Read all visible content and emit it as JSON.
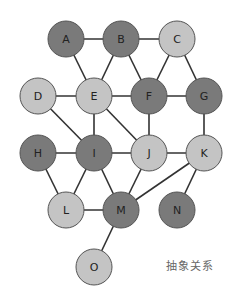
{
  "caption": "抽象关系",
  "colors": {
    "dark": "#7a7a7a",
    "light": "#c4c4c4",
    "stroke": "#555555",
    "edge": "#333333",
    "label": "#222222"
  },
  "radius": 18,
  "nodes": [
    {
      "id": "A",
      "x": 66,
      "y": 39,
      "shade": "dark"
    },
    {
      "id": "B",
      "x": 121,
      "y": 39,
      "shade": "dark"
    },
    {
      "id": "C",
      "x": 177,
      "y": 39,
      "shade": "light"
    },
    {
      "id": "D",
      "x": 38,
      "y": 96,
      "shade": "light"
    },
    {
      "id": "E",
      "x": 94,
      "y": 96,
      "shade": "light"
    },
    {
      "id": "F",
      "x": 149,
      "y": 96,
      "shade": "dark"
    },
    {
      "id": "G",
      "x": 204,
      "y": 96,
      "shade": "dark"
    },
    {
      "id": "H",
      "x": 38,
      "y": 153,
      "shade": "dark"
    },
    {
      "id": "I",
      "x": 94,
      "y": 153,
      "shade": "dark"
    },
    {
      "id": "J",
      "x": 149,
      "y": 153,
      "shade": "light"
    },
    {
      "id": "K",
      "x": 204,
      "y": 153,
      "shade": "light"
    },
    {
      "id": "L",
      "x": 66,
      "y": 210,
      "shade": "light"
    },
    {
      "id": "M",
      "x": 121,
      "y": 210,
      "shade": "dark"
    },
    {
      "id": "N",
      "x": 177,
      "y": 210,
      "shade": "dark"
    },
    {
      "id": "O",
      "x": 94,
      "y": 267,
      "shade": "light"
    }
  ],
  "edges": [
    [
      "A",
      "B"
    ],
    [
      "B",
      "C"
    ],
    [
      "A",
      "E"
    ],
    [
      "B",
      "E"
    ],
    [
      "B",
      "F"
    ],
    [
      "C",
      "F"
    ],
    [
      "C",
      "G"
    ],
    [
      "D",
      "E"
    ],
    [
      "E",
      "F"
    ],
    [
      "F",
      "G"
    ],
    [
      "D",
      "I"
    ],
    [
      "E",
      "I"
    ],
    [
      "E",
      "J"
    ],
    [
      "F",
      "J"
    ],
    [
      "G",
      "K"
    ],
    [
      "H",
      "I"
    ],
    [
      "I",
      "J"
    ],
    [
      "J",
      "K"
    ],
    [
      "H",
      "L"
    ],
    [
      "I",
      "L"
    ],
    [
      "I",
      "M"
    ],
    [
      "J",
      "M"
    ],
    [
      "K",
      "M"
    ],
    [
      "K",
      "N"
    ],
    [
      "L",
      "M"
    ],
    [
      "M",
      "O"
    ]
  ]
}
